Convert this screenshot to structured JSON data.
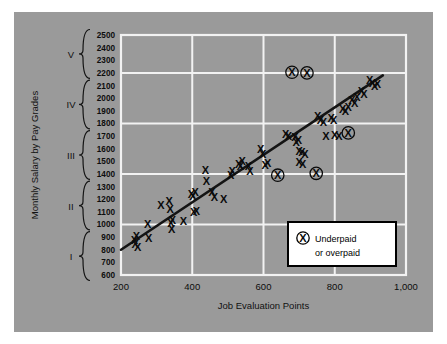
{
  "figure": {
    "background_color": "#9a9a9a",
    "page_color": "#ffffff",
    "grid_color": "#f2f2f2",
    "mark_color": "#0a0a0a",
    "line_color": "#141414"
  },
  "legend": {
    "symbol": "X",
    "line1": "Underpaid",
    "line2": "or overpaid"
  },
  "grades": [
    {
      "label": "V",
      "min": 2200,
      "max": 2500
    },
    {
      "label": "IV",
      "min": 1800,
      "max": 2100
    },
    {
      "label": "III",
      "min": 1400,
      "max": 1700
    },
    {
      "label": "II",
      "min": 1000,
      "max": 1300
    },
    {
      "label": "I",
      "min": 600,
      "max": 900
    }
  ],
  "chart_data": {
    "type": "scatter",
    "title": "",
    "xlabel": "Job Evaluation Points",
    "ylabel": "Monthly Salary by Pay Grades",
    "xlim": [
      200,
      1000
    ],
    "ylim": [
      600,
      2500
    ],
    "xticks": [
      200,
      400,
      600,
      800,
      1000
    ],
    "xtick_labels": [
      "200",
      "400",
      "600",
      "800",
      "1,000"
    ],
    "yticks": [
      600,
      700,
      800,
      900,
      1000,
      1100,
      1200,
      1300,
      1400,
      1500,
      1600,
      1700,
      1800,
      1900,
      2000,
      2100,
      2200,
      2300,
      2400,
      2500
    ],
    "ytick_labels": [
      "600",
      "700",
      "800",
      "900",
      "1000",
      "1100",
      "1200",
      "1300",
      "1400",
      "1500",
      "1600",
      "1700",
      "1800",
      "1900",
      "2000",
      "2100",
      "2200",
      "2300",
      "2400",
      "2500"
    ],
    "xgrid_lines": [
      400,
      600,
      800
    ],
    "ygrid_lines": [
      1000,
      1400,
      1800,
      2200
    ],
    "grid": true,
    "legend_position": "lower-right",
    "trendline": {
      "name": "Wage trend line",
      "x": [
        200,
        935
      ],
      "y": [
        800,
        2180
      ]
    },
    "series": [
      {
        "name": "Employees",
        "marker": "x",
        "points": [
          [
            238,
            880
          ],
          [
            240,
            845
          ],
          [
            243,
            905
          ],
          [
            247,
            820
          ],
          [
            275,
            1005
          ],
          [
            278,
            895
          ],
          [
            312,
            1155
          ],
          [
            335,
            1185
          ],
          [
            338,
            1120
          ],
          [
            340,
            1010
          ],
          [
            342,
            965
          ],
          [
            344,
            1035
          ],
          [
            375,
            1025
          ],
          [
            398,
            1245
          ],
          [
            402,
            1225
          ],
          [
            404,
            1100
          ],
          [
            408,
            1260
          ],
          [
            412,
            1105
          ],
          [
            437,
            1430
          ],
          [
            440,
            1345
          ],
          [
            455,
            1255
          ],
          [
            462,
            1215
          ],
          [
            488,
            1205
          ],
          [
            508,
            1395
          ],
          [
            512,
            1420
          ],
          [
            530,
            1480
          ],
          [
            535,
            1460
          ],
          [
            540,
            1505
          ],
          [
            558,
            1465
          ],
          [
            562,
            1425
          ],
          [
            592,
            1595
          ],
          [
            598,
            1560
          ],
          [
            605,
            1470
          ],
          [
            612,
            1490
          ],
          [
            662,
            1720
          ],
          [
            670,
            1700
          ],
          [
            688,
            1690
          ],
          [
            692,
            1655
          ],
          [
            698,
            1670
          ],
          [
            700,
            1585
          ],
          [
            708,
            1570
          ],
          [
            716,
            1560
          ],
          [
            700,
            1495
          ],
          [
            710,
            1480
          ],
          [
            752,
            1855
          ],
          [
            760,
            1830
          ],
          [
            768,
            1815
          ],
          [
            775,
            1700
          ],
          [
            790,
            1845
          ],
          [
            797,
            1830
          ],
          [
            800,
            1705
          ],
          [
            812,
            1700
          ],
          [
            822,
            1915
          ],
          [
            830,
            1900
          ],
          [
            838,
            1930
          ],
          [
            848,
            1985
          ],
          [
            856,
            1960
          ],
          [
            862,
            2010
          ],
          [
            875,
            2055
          ],
          [
            882,
            2030
          ],
          [
            898,
            2140
          ],
          [
            906,
            2120
          ],
          [
            912,
            2095
          ],
          [
            920,
            2110
          ]
        ]
      },
      {
        "name": "Underpaid or overpaid",
        "marker": "circled-x",
        "points": [
          [
            680,
            2205
          ],
          [
            722,
            2200
          ],
          [
            838,
            1725
          ],
          [
            640,
            1390
          ],
          [
            748,
            1405
          ]
        ]
      }
    ]
  }
}
